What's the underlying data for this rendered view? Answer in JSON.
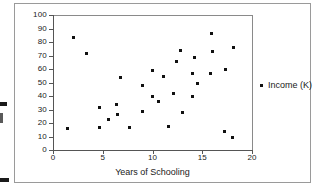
{
  "chart_data": {
    "type": "scatter",
    "title": "",
    "xlabel": "Years of Schooling",
    "ylabel": "",
    "xlim": [
      0,
      20
    ],
    "ylim": [
      0,
      100
    ],
    "xticks": [
      "0",
      "5",
      "10",
      "15",
      "20"
    ],
    "yticks": [
      "0",
      "10",
      "20",
      "30",
      "40",
      "50",
      "60",
      "70",
      "80",
      "90",
      "100"
    ],
    "grid": false,
    "legend_position": "right",
    "series": [
      {
        "name": "Income (K)",
        "marker": "square",
        "color": "#111111",
        "points": [
          [
            1.4,
            16
          ],
          [
            2.0,
            84
          ],
          [
            3.3,
            72
          ],
          [
            4.6,
            32
          ],
          [
            4.6,
            17
          ],
          [
            5.5,
            23
          ],
          [
            6.3,
            34
          ],
          [
            6.4,
            27
          ],
          [
            6.7,
            54
          ],
          [
            7.6,
            17
          ],
          [
            8.9,
            29
          ],
          [
            8.9,
            48
          ],
          [
            9.9,
            40
          ],
          [
            9.9,
            59
          ],
          [
            10.6,
            36
          ],
          [
            11.1,
            55
          ],
          [
            11.6,
            18
          ],
          [
            12.1,
            42
          ],
          [
            12.4,
            66
          ],
          [
            12.8,
            74
          ],
          [
            13.0,
            28
          ],
          [
            14.0,
            40
          ],
          [
            14.0,
            57
          ],
          [
            14.2,
            69
          ],
          [
            14.5,
            50
          ],
          [
            15.8,
            57
          ],
          [
            15.9,
            87
          ],
          [
            16.0,
            73
          ],
          [
            17.2,
            14
          ],
          [
            17.3,
            60
          ],
          [
            18.0,
            10
          ],
          [
            18.1,
            76
          ]
        ]
      }
    ]
  },
  "legend": {
    "entries": [
      {
        "label": "Income (K)"
      }
    ]
  },
  "axes": {
    "x_title": "Years of Schooling",
    "y_title": ""
  },
  "icons": {
    "legend_marker": "square-marker-icon"
  }
}
